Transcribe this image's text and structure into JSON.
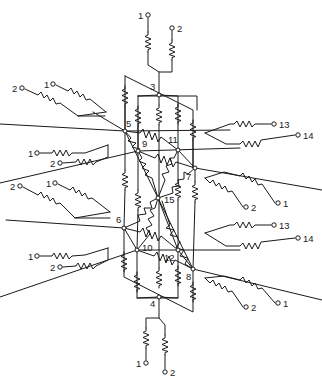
{
  "diagram": {
    "type": "resistor-network",
    "nodes": [
      {
        "id": "3",
        "label": "3",
        "x": 159,
        "y": 95,
        "lx": 150,
        "ly": 90
      },
      {
        "id": "4",
        "label": "4",
        "x": 159,
        "y": 297,
        "lx": 150,
        "ly": 307
      },
      {
        "id": "5",
        "label": "5",
        "x": 125,
        "y": 131,
        "lx": 126,
        "ly": 127
      },
      {
        "id": "6",
        "label": "6",
        "x": 124,
        "y": 228,
        "lx": 116,
        "ly": 223
      },
      {
        "id": "9",
        "label": "9",
        "x": 138,
        "y": 151,
        "lx": 142,
        "ly": 147
      },
      {
        "id": "10",
        "label": "10",
        "x": 137,
        "y": 250,
        "lx": 142,
        "ly": 251
      },
      {
        "id": "11",
        "label": "11",
        "x": 178,
        "y": 150,
        "lx": 168,
        "ly": 143
      },
      {
        "id": "12",
        "label": "12",
        "x": 178,
        "y": 250,
        "lx": 164,
        "ly": 261
      },
      {
        "id": "7",
        "label": "7",
        "x": 195,
        "y": 168,
        "lx": 186,
        "ly": 180
      },
      {
        "id": "8",
        "label": "8",
        "x": 193,
        "y": 269,
        "lx": 186,
        "ly": 280
      },
      {
        "id": "15",
        "label": "15",
        "x": 158,
        "y": 198,
        "lx": 164,
        "ly": 203
      }
    ],
    "terminals": [
      {
        "label": "1",
        "x": 148,
        "y": 15,
        "lx": 138,
        "ly": 19
      },
      {
        "label": "2",
        "x": 172,
        "y": 28,
        "lx": 177,
        "ly": 32
      },
      {
        "label": "2",
        "x": 22,
        "y": 88,
        "lx": 12,
        "ly": 92
      },
      {
        "label": "1",
        "x": 53,
        "y": 84,
        "lx": 44,
        "ly": 88
      },
      {
        "label": "1",
        "x": 37,
        "y": 153,
        "lx": 28,
        "ly": 157
      },
      {
        "label": "2",
        "x": 60,
        "y": 163,
        "lx": 50,
        "ly": 167
      },
      {
        "label": "2",
        "x": 20,
        "y": 186,
        "lx": 10,
        "ly": 190
      },
      {
        "label": "1",
        "x": 55,
        "y": 183,
        "lx": 46,
        "ly": 187
      },
      {
        "label": "1",
        "x": 37,
        "y": 256,
        "lx": 28,
        "ly": 260
      },
      {
        "label": "2",
        "x": 60,
        "y": 267,
        "lx": 50,
        "ly": 271
      },
      {
        "label": "13",
        "x": 274,
        "y": 124,
        "lx": 279,
        "ly": 128
      },
      {
        "label": "14",
        "x": 298,
        "y": 135,
        "lx": 303,
        "ly": 139
      },
      {
        "label": "1",
        "x": 278,
        "y": 203,
        "lx": 283,
        "ly": 207
      },
      {
        "label": "2",
        "x": 246,
        "y": 207,
        "lx": 251,
        "ly": 211
      },
      {
        "label": "13",
        "x": 274,
        "y": 225,
        "lx": 279,
        "ly": 229
      },
      {
        "label": "14",
        "x": 298,
        "y": 238,
        "lx": 303,
        "ly": 242
      },
      {
        "label": "1",
        "x": 278,
        "y": 303,
        "lx": 283,
        "ly": 307
      },
      {
        "label": "2",
        "x": 246,
        "y": 307,
        "lx": 251,
        "ly": 311
      },
      {
        "label": "1",
        "x": 146,
        "y": 363,
        "lx": 136,
        "ly": 367
      },
      {
        "label": "2",
        "x": 165,
        "y": 372,
        "lx": 170,
        "ly": 376
      }
    ]
  }
}
